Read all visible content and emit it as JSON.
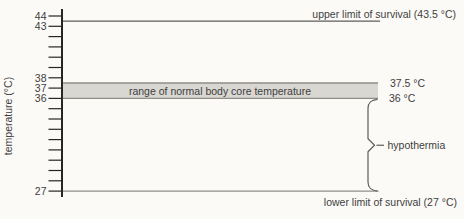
{
  "chart_data": {
    "type": "line",
    "title": "",
    "xlabel": "",
    "ylabel": "temperature (°C)",
    "ylim": [
      27,
      44
    ],
    "yticks": {
      "min": 27,
      "max": 44,
      "step": 1,
      "labeled": [
        "44",
        "43",
        "38",
        "37",
        "36",
        "27"
      ]
    },
    "grid": false,
    "legend": "none",
    "annotations": {
      "upper_limit": {
        "kind": "hline",
        "temp_c": 43.5,
        "label": "upper limit of survival (43.5 °C)"
      },
      "normal_band": {
        "kind": "band",
        "temp_low_c": 36,
        "temp_high_c": 37.5,
        "label": "range of normal body core temperature",
        "high_edge_label": "37.5 °C",
        "low_edge_label": "36 °C"
      },
      "hypothermia_brace": {
        "kind": "brace",
        "temp_low_c": 27,
        "temp_high_c": 36,
        "label": "hypothermia"
      },
      "lower_limit": {
        "kind": "hline",
        "temp_c": 27,
        "label": "lower limit of survival (27 °C)"
      }
    },
    "colors": {
      "background": "#fbfaf6",
      "text": "#3e3e3e",
      "axis": "#262626",
      "upper_limit_line": "#5c5c5c",
      "lower_limit_line": "#8e8e8e",
      "band_fill": "#d9d7d2",
      "band_edge": "#918e89",
      "brace": "#5c5c5c"
    }
  }
}
